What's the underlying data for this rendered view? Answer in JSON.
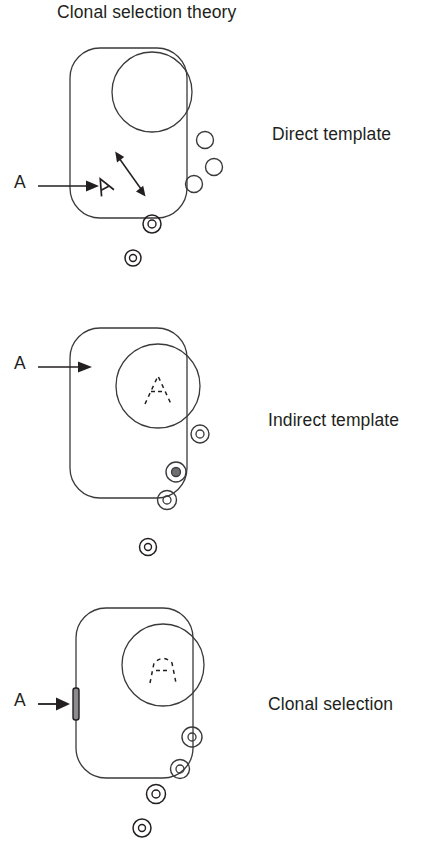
{
  "figure": {
    "title": "Clonal selection theory",
    "background_color": "#ffffff",
    "stroke_color": "#3a3a3c",
    "ink_color": "#231f20",
    "width": 447,
    "height": 844
  },
  "panels": [
    {
      "id": "direct-template",
      "label": "Direct template",
      "antigen_label": "A",
      "antigen_arrow": "arrow-right-icon",
      "label_position": {
        "x": 272,
        "y": 123
      },
      "antigen_label_position": {
        "x": 14,
        "y": 170
      },
      "cell": {
        "x": 70,
        "y": 48,
        "width": 117,
        "height": 170,
        "radius": 30
      },
      "nucleus": {
        "cx": 152,
        "cy": 92,
        "r": 40
      },
      "nucleus_content": "none",
      "receptor": "none",
      "internal_antigen": {
        "glyph": "antigen-a-glyph",
        "x": 104,
        "y": 186,
        "rotation": -28
      },
      "double_arrow": {
        "x1": 143,
        "y1": 192,
        "x2": 117,
        "y2": 155
      },
      "plain_circles": [
        {
          "cx": 205,
          "cy": 140,
          "r": 8.5
        },
        {
          "cx": 214,
          "cy": 167,
          "r": 8.5
        },
        {
          "cx": 194,
          "cy": 184,
          "r": 8.5
        }
      ],
      "double_circles": [
        {
          "cx": 152,
          "cy": 224,
          "r_outer": 9,
          "r_inner": 4,
          "position": "on-membrane"
        },
        {
          "cx": 133,
          "cy": 258,
          "r_outer": 8,
          "r_inner": 3.5,
          "position": "outside"
        }
      ]
    },
    {
      "id": "indirect-template",
      "label": "Indirect template",
      "antigen_label": "A",
      "antigen_arrow": "arrow-right-icon",
      "label_position": {
        "x": 268,
        "y": 419
      },
      "antigen_label_position": {
        "x": 14,
        "y": 361
      },
      "cell": {
        "x": 70,
        "y": 328,
        "width": 117,
        "height": 170,
        "radius": 30
      },
      "nucleus": {
        "cx": 158,
        "cy": 386,
        "r": 42
      },
      "nucleus_content": "dashed-a-template",
      "receptor": "none",
      "internal_antigen": "none",
      "double_arrow": "none",
      "plain_circles": [],
      "double_circles": [
        {
          "cx": 200,
          "cy": 434,
          "r_outer": 9,
          "r_inner": 4,
          "position": "inside"
        },
        {
          "cx": 176,
          "cy": 472,
          "r_outer": 10,
          "r_inner": 4.5,
          "position": "inside"
        },
        {
          "cx": 167,
          "cy": 500,
          "r_outer": 9.5,
          "r_inner": 4,
          "position": "inside"
        },
        {
          "cx": 148,
          "cy": 547,
          "r_outer": 8.5,
          "r_inner": 3.5,
          "position": "outside"
        }
      ]
    },
    {
      "id": "clonal-selection",
      "label": "Clonal selection",
      "antigen_label": "A",
      "antigen_arrow": "arrow-right-icon",
      "label_position": {
        "x": 268,
        "y": 694
      },
      "antigen_label_position": {
        "x": 14,
        "y": 695
      },
      "cell": {
        "x": 76,
        "y": 608,
        "width": 117,
        "height": 170,
        "radius": 30
      },
      "nucleus": {
        "cx": 163,
        "cy": 665,
        "r": 41
      },
      "nucleus_content": "dashed-a-template",
      "receptor": {
        "glyph": "membrane-receptor-icon",
        "x": 72,
        "y": 688,
        "width": 6,
        "height": 32
      },
      "internal_antigen": "none",
      "double_arrow": "none",
      "plain_circles": [],
      "double_circles": [
        {
          "cx": 192,
          "cy": 737,
          "r_outer": 10,
          "r_inner": 4,
          "position": "inside"
        },
        {
          "cx": 180,
          "cy": 769,
          "r_outer": 9.5,
          "r_inner": 4,
          "position": "inside"
        },
        {
          "cx": 156,
          "cy": 794,
          "r_outer": 9.5,
          "r_inner": 4,
          "position": "on-membrane"
        },
        {
          "cx": 142,
          "cy": 828,
          "r_outer": 9,
          "r_inner": 3.5,
          "position": "outside"
        }
      ]
    }
  ],
  "diagram_data": {
    "type": "diagram",
    "subject": "Clonal selection theory — three models of antibody production",
    "models": [
      {
        "name": "Direct template",
        "description": "Antigen A enters the cell and acts directly as a template; double-headed arrow indicates reversible templating; plain antibody circles present."
      },
      {
        "name": "Indirect template",
        "description": "Antigen A instructs the nucleus, which carries a dashed antigen-shaped template; antibodies produced carry the complementary binding site."
      },
      {
        "name": "Clonal selection",
        "description": "Antigen A binds a pre-existing membrane receptor; the nucleus already encodes the template and the selected clone secretes matching antibodies."
      }
    ]
  }
}
